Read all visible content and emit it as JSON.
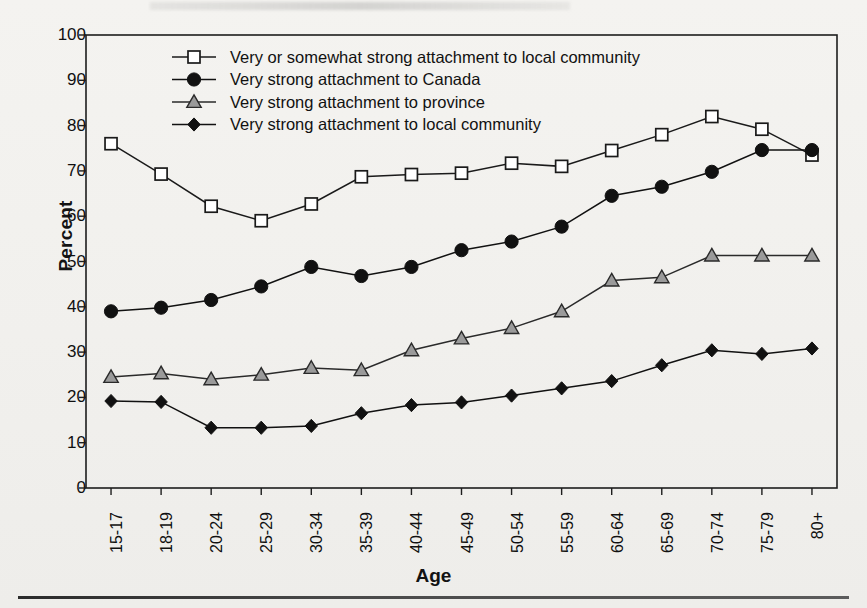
{
  "chart_data": {
    "type": "line",
    "title": "",
    "xlabel": "Age",
    "ylabel": "Percent",
    "ylim": [
      0,
      100
    ],
    "ytick_step": 10,
    "yticks": [
      0,
      10,
      20,
      30,
      40,
      50,
      60,
      70,
      80,
      90,
      100
    ],
    "grid": false,
    "legend_position": "top-center-inside",
    "categories": [
      "15-17",
      "18-19",
      "20-24",
      "25-29",
      "30-34",
      "35-39",
      "40-44",
      "45-49",
      "50-54",
      "55-59",
      "60-64",
      "65-69",
      "70-74",
      "75-79",
      "80+"
    ],
    "series": [
      {
        "name": "Very or somewhat strong attachment to local community",
        "marker": "square-open",
        "color": "#1a1a1a",
        "fill": "#ffffff",
        "values": [
          76.0,
          69.3,
          62.2,
          59.0,
          62.7,
          68.7,
          69.2,
          69.5,
          71.7,
          71.0,
          74.5,
          78.0,
          82.0,
          79.2,
          73.5
        ]
      },
      {
        "name": "Very strong attachment to Canada",
        "marker": "circle-filled",
        "color": "#111111",
        "fill": "#111111",
        "values": [
          39.0,
          39.8,
          41.5,
          44.5,
          48.8,
          46.8,
          48.8,
          52.5,
          54.4,
          57.7,
          64.5,
          66.5,
          69.8,
          74.6,
          74.6
        ]
      },
      {
        "name": "Very strong attachment to province",
        "marker": "triangle-grey",
        "color": "#2a2a2a",
        "fill": "#9a9a9a",
        "values": [
          24.5,
          25.3,
          24.0,
          25.0,
          26.5,
          26.0,
          30.4,
          33.0,
          35.3,
          39.0,
          45.8,
          46.5,
          51.3,
          51.3,
          51.3
        ]
      },
      {
        "name": "Very strong attachment to local community",
        "marker": "diamond-filled",
        "color": "#111111",
        "fill": "#111111",
        "values": [
          19.2,
          19.0,
          13.3,
          13.3,
          13.7,
          16.5,
          18.3,
          18.9,
          20.4,
          22.0,
          23.6,
          27.1,
          30.4,
          29.6,
          30.8
        ]
      }
    ]
  },
  "axis": {
    "y_title": "Percent",
    "x_title": "Age"
  }
}
